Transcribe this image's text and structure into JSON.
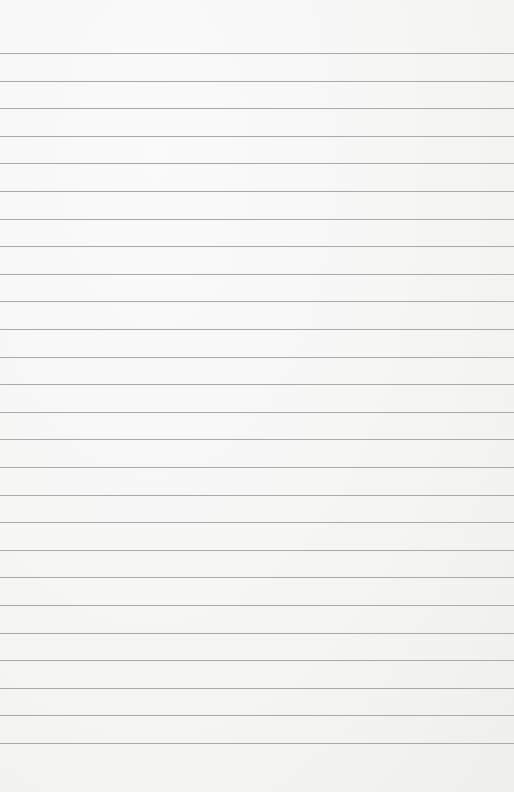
{
  "page": {
    "type": "lined-paper",
    "background_color": "#f7f7f6",
    "line_color": "#a9a9a9",
    "line_count": 26,
    "first_line_y": 53,
    "line_spacing": 27.6
  }
}
